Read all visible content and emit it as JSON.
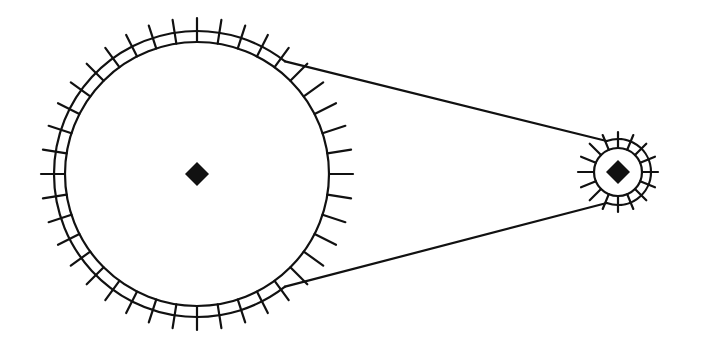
{
  "diagram": {
    "title": "Chain drive: large sprocket and small sprocket connected by a chain",
    "colors": {
      "line": "#111111",
      "background": "#ffffff"
    },
    "large_sprocket": {
      "label": "Large sprocket",
      "cx": 197,
      "cy": 174,
      "radius": 132,
      "chain_radius": 143,
      "tick_outer_radius": 156,
      "tooth_count": 40,
      "hub_shape": "diamond",
      "hub_size": 12
    },
    "small_sprocket": {
      "label": "Small sprocket",
      "cx": 618,
      "cy": 172,
      "radius": 24,
      "chain_radius": 33,
      "tick_outer_radius": 40,
      "tooth_count": 16,
      "hub_shape": "diamond",
      "hub_size": 12
    },
    "chain": {
      "label": "Chain",
      "upper_span": {
        "x1": 300,
        "y1": 44,
        "x2": 626,
        "y2": 136
      },
      "lower_span": {
        "x1": 300,
        "y1": 304,
        "x2": 626,
        "y2": 212
      }
    }
  }
}
